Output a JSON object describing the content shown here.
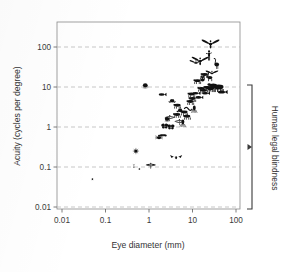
{
  "chart_data": {
    "type": "scatter",
    "title": "",
    "xlabel": "Eye diameter (mm)",
    "ylabel": "Acuity (cycles per degree)",
    "xscale": "log",
    "yscale": "log",
    "xlim": [
      0.005,
      160
    ],
    "ylim": [
      0.007,
      300
    ],
    "xticks": [
      "0.01",
      "0.1",
      "1",
      "10",
      "100"
    ],
    "xtick_values": [
      0.01,
      0.1,
      1,
      10,
      100
    ],
    "yticks": [
      "0.01",
      "0.1",
      "1",
      "10",
      "100"
    ],
    "ytick_values": [
      0.01,
      0.1,
      1,
      10,
      100
    ],
    "grid": "horizontal dashed gridlines at each y decade",
    "legend": "none",
    "marker_style": "animal silhouette icons",
    "annotations": [
      {
        "label": "Human legal blindness",
        "type": "bracket",
        "orientation": "vertical-right",
        "y_range": [
          0.01,
          10
        ],
        "x_position": 130
      }
    ],
    "points": [
      {
        "name": "mite",
        "icon": "mite",
        "x": 0.05,
        "y": 0.05
      },
      {
        "name": "ant",
        "icon": "ant",
        "x": 0.45,
        "y": 0.105
      },
      {
        "name": "fruit fly",
        "icon": "fly",
        "x": 0.6,
        "y": 0.09
      },
      {
        "name": "jumping spider",
        "icon": "spider",
        "x": 0.5,
        "y": 0.25
      },
      {
        "name": "horseshoe crab",
        "icon": "crab",
        "x": 0.82,
        "y": 11
      },
      {
        "name": "dragonfly small",
        "icon": "dragonfly",
        "x": 1.1,
        "y": 0.11
      },
      {
        "name": "beetle",
        "icon": "beetle",
        "x": 1.7,
        "y": 0.55
      },
      {
        "name": "moth",
        "icon": "moth",
        "x": 2.1,
        "y": 0.62
      },
      {
        "name": "bat",
        "icon": "bat",
        "x": 4.2,
        "y": 0.17
      },
      {
        "name": "crab",
        "icon": "crab2",
        "x": 2.6,
        "y": 1.6
      },
      {
        "name": "butterfly",
        "icon": "butterfly",
        "x": 2.3,
        "y": 1.05
      },
      {
        "name": "butterfly 2",
        "icon": "butterfly",
        "x": 3.2,
        "y": 1.0
      },
      {
        "name": "mantis",
        "icon": "mantis",
        "x": 3.0,
        "y": 1.7
      },
      {
        "name": "dragonfly",
        "icon": "dragonfly",
        "x": 5.0,
        "y": 1.35
      },
      {
        "name": "squid",
        "icon": "squid",
        "x": 6.0,
        "y": 1.25
      },
      {
        "name": "fish small",
        "icon": "fish",
        "x": 2.0,
        "y": 6.5
      },
      {
        "name": "frog",
        "icon": "frog",
        "x": 3.4,
        "y": 4.5
      },
      {
        "name": "lizard",
        "icon": "lizard",
        "x": 4.5,
        "y": 3.4
      },
      {
        "name": "toad",
        "icon": "frog2",
        "x": 5.2,
        "y": 2.6
      },
      {
        "name": "mouse",
        "icon": "mouse",
        "x": 4.4,
        "y": 2.0
      },
      {
        "name": "rat",
        "icon": "rat",
        "x": 6.5,
        "y": 2.3
      },
      {
        "name": "shrew",
        "icon": "shrew",
        "x": 7.5,
        "y": 1.8
      },
      {
        "name": "snake",
        "icon": "snake",
        "x": 8.0,
        "y": 3.0
      },
      {
        "name": "turtle",
        "icon": "turtle",
        "x": 9.0,
        "y": 4.2
      },
      {
        "name": "rabbit",
        "icon": "rabbit",
        "x": 10.0,
        "y": 5.0
      },
      {
        "name": "octopus",
        "icon": "octopus",
        "x": 11.0,
        "y": 2.8
      },
      {
        "name": "squirrel",
        "icon": "squirrel",
        "x": 9.5,
        "y": 6.5
      },
      {
        "name": "fish",
        "icon": "fish2",
        "x": 12.0,
        "y": 7.0
      },
      {
        "name": "shark",
        "icon": "shark",
        "x": 14.0,
        "y": 5.5
      },
      {
        "name": "cat",
        "icon": "cat",
        "x": 16.0,
        "y": 9.0
      },
      {
        "name": "dog",
        "icon": "dog",
        "x": 18.0,
        "y": 8.0
      },
      {
        "name": "seal",
        "icon": "seal",
        "x": 20.0,
        "y": 7.0
      },
      {
        "name": "pig",
        "icon": "pig",
        "x": 22.0,
        "y": 9.5
      },
      {
        "name": "cow",
        "icon": "cow",
        "x": 26.0,
        "y": 9.0
      },
      {
        "name": "horse",
        "icon": "horse",
        "x": 30.0,
        "y": 10.5
      },
      {
        "name": "elephant",
        "icon": "elephant",
        "x": 40.0,
        "y": 9.5
      },
      {
        "name": "whale",
        "icon": "whale",
        "x": 48.0,
        "y": 7.5
      },
      {
        "name": "owl",
        "icon": "owl",
        "x": 17.0,
        "y": 16.0
      },
      {
        "name": "giraffe",
        "icon": "giraffe",
        "x": 24.0,
        "y": 18.0
      },
      {
        "name": "monkey",
        "icon": "monkey",
        "x": 19.0,
        "y": 20.0
      },
      {
        "name": "chameleon",
        "icon": "chameleon",
        "x": 13.0,
        "y": 14.0
      },
      {
        "name": "parrot",
        "icon": "parrot",
        "x": 28.0,
        "y": 22.0
      },
      {
        "name": "falcon",
        "icon": "falcon",
        "x": 12.0,
        "y": 40.0
      },
      {
        "name": "hawk",
        "icon": "hawk",
        "x": 15.0,
        "y": 45.0
      },
      {
        "name": "human",
        "icon": "human",
        "x": 24.0,
        "y": 60.0
      },
      {
        "name": "ostrich",
        "icon": "ostrich",
        "x": 35.0,
        "y": 40.0
      },
      {
        "name": "eagle",
        "icon": "eagle",
        "x": 26.0,
        "y": 120.0
      }
    ]
  },
  "axes": {
    "x_title": "Eye diameter (mm)",
    "y_title": "Acuity (cycles per degree)"
  },
  "colors": {
    "marker": "#111111",
    "grid": "#b9b9b9",
    "axis": "#6f6f6f",
    "text": "#3b3b3b",
    "background": "#ffffff"
  }
}
